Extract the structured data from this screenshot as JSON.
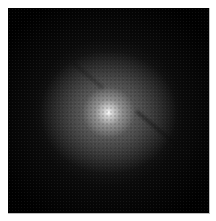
{
  "image": {
    "subject": "elliptical/spiral galaxy with diagonal dust lane",
    "background_color": "#000000",
    "page_color": "#ffffff",
    "core_color": "#f2f2f2"
  }
}
